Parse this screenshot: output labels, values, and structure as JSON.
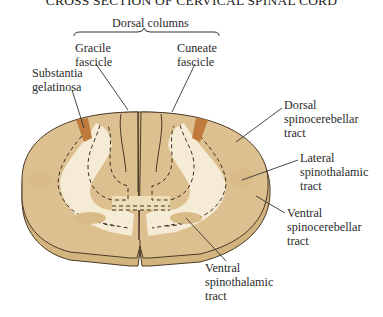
{
  "title": "CROSS SECTION OF CERVICAL SPINAL CORD",
  "group_label": "Dorsal columns",
  "labels": {
    "gracile": [
      "Gracile",
      "fascicle"
    ],
    "cuneate": [
      "Cuneate",
      "fascicle"
    ],
    "substantia": [
      "Substantia",
      "gelatinosa"
    ],
    "dorsal_spinocerebellar": [
      "Dorsal",
      "spinocerebellar",
      "tract"
    ],
    "lateral_spinothalamic": [
      "Lateral",
      "spinothalamic",
      "tract"
    ],
    "ventral_spinocerebellar": [
      "Ventral",
      "spinocerebellar",
      "tract"
    ],
    "ventral_spinothalamic": [
      "Ventral",
      "spinothalamic",
      "tract"
    ]
  },
  "colors": {
    "white_matter": "#dcc08f",
    "gray_matter": "#f6ecd6",
    "substantia_gelatinosa": "#c07a3c",
    "outline": "#4a3a28",
    "base_shadow": "#d3b47e"
  }
}
